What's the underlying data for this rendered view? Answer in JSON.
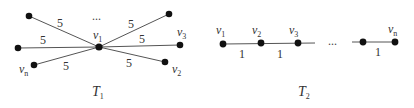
{
  "diagram": {
    "T1": {
      "caption": "T",
      "caption_sub": "1",
      "center_label": "v",
      "center_sub": "1",
      "ellipsis": "...",
      "edge_weight": "5",
      "labels": {
        "v3": {
          "base": "v",
          "sub": "3"
        },
        "v2": {
          "base": "v",
          "sub": "2"
        },
        "vn": {
          "base": "v",
          "sub": "n"
        }
      },
      "weights": [
        "5",
        "5",
        "5",
        "5",
        "5",
        "5"
      ]
    },
    "T2": {
      "caption": "T",
      "caption_sub": "2",
      "ellipsis": "...",
      "labels": {
        "v1": {
          "base": "v",
          "sub": "1"
        },
        "v2": {
          "base": "v",
          "sub": "2"
        },
        "v3": {
          "base": "v",
          "sub": "3"
        },
        "vn": {
          "base": "v",
          "sub": "n"
        }
      },
      "weights": [
        "1",
        "1",
        "1"
      ]
    }
  }
}
